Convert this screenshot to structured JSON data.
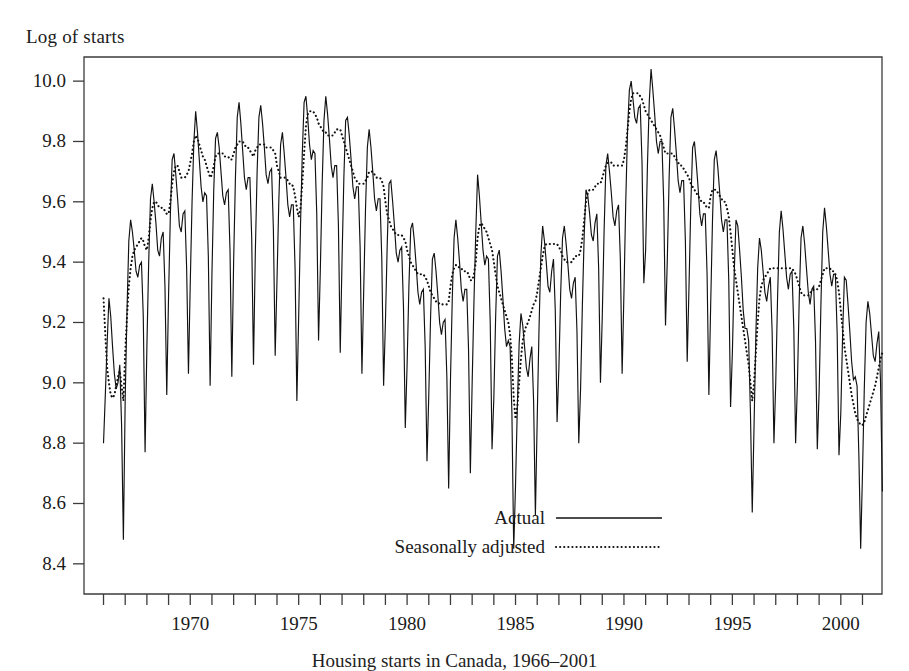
{
  "figure": {
    "ylabel": "Log of starts",
    "caption": "Housing starts in Canada, 1966–2001"
  },
  "legend": {
    "items": [
      {
        "label": "Actual",
        "style": "solid"
      },
      {
        "label": "Seasonally adjusted",
        "style": "dotted"
      }
    ]
  },
  "chart_data": {
    "type": "line",
    "title": "",
    "subtitle": "",
    "xlabel": "",
    "ylabel": "Log of starts",
    "xlim": [
      1965.1,
      2001.9
    ],
    "ylim": [
      8.3,
      10.08
    ],
    "grid": false,
    "legend_position": "bottom-center",
    "yticks": [
      8.4,
      8.6,
      9.0,
      9.2,
      9.4,
      9.6,
      9.8,
      10.0
    ],
    "ytick_labels": [
      "8.4",
      "8.6",
      "8.8",
      "9.0",
      "9.2",
      "9.4",
      "9.6",
      "9.8",
      "10.0"
    ],
    "ytick_values": [
      8.4,
      8.6,
      8.8,
      9.0,
      9.2,
      9.4,
      9.6,
      9.8,
      10.0
    ],
    "xticks_minor_step": 1,
    "xtick_labels": [
      "1970",
      "1975",
      "1980",
      "1985",
      "1990",
      "1995",
      "2000"
    ],
    "xtick_values": [
      1970,
      1975,
      1980,
      1985,
      1990,
      1995,
      2000
    ],
    "x_start": 1966.0,
    "x_step": 0.0833333,
    "n_points": 427,
    "series": [
      {
        "name": "Actual",
        "style": "solid",
        "values": [
          8.8,
          8.96,
          9.13,
          9.28,
          9.22,
          9.12,
          9.03,
          8.98,
          9.0,
          9.06,
          8.86,
          8.48,
          8.95,
          9.24,
          9.47,
          9.54,
          9.5,
          9.44,
          9.37,
          9.35,
          9.39,
          9.4,
          9.22,
          8.77,
          9.12,
          9.4,
          9.61,
          9.66,
          9.6,
          9.53,
          9.44,
          9.42,
          9.48,
          9.5,
          9.32,
          8.96,
          9.29,
          9.56,
          9.74,
          9.76,
          9.69,
          9.61,
          9.52,
          9.5,
          9.56,
          9.57,
          9.38,
          9.03,
          9.33,
          9.6,
          9.8,
          9.9,
          9.83,
          9.74,
          9.65,
          9.6,
          9.63,
          9.62,
          9.42,
          8.99,
          9.36,
          9.64,
          9.81,
          9.83,
          9.78,
          9.7,
          9.62,
          9.59,
          9.63,
          9.64,
          9.44,
          9.02,
          9.4,
          9.68,
          9.88,
          9.93,
          9.86,
          9.77,
          9.68,
          9.64,
          9.68,
          9.68,
          9.48,
          9.06,
          9.43,
          9.7,
          9.88,
          9.92,
          9.86,
          9.78,
          9.69,
          9.66,
          9.7,
          9.71,
          9.51,
          9.09,
          9.34,
          9.6,
          9.79,
          9.83,
          9.76,
          9.68,
          9.59,
          9.55,
          9.59,
          9.59,
          9.38,
          8.94,
          9.22,
          9.52,
          9.76,
          9.93,
          9.95,
          9.88,
          9.79,
          9.74,
          9.77,
          9.76,
          9.56,
          9.14,
          9.38,
          9.66,
          9.87,
          9.95,
          9.89,
          9.81,
          9.72,
          9.68,
          9.72,
          9.72,
          9.52,
          9.1,
          9.41,
          9.68,
          9.87,
          9.88,
          9.82,
          9.74,
          9.65,
          9.61,
          9.65,
          9.65,
          9.45,
          9.03,
          9.31,
          9.58,
          9.78,
          9.84,
          9.78,
          9.7,
          9.61,
          9.57,
          9.61,
          9.61,
          9.41,
          8.99,
          9.2,
          9.46,
          9.66,
          9.67,
          9.6,
          9.52,
          9.43,
          9.4,
          9.44,
          9.45,
          9.25,
          8.85,
          9.06,
          9.32,
          9.51,
          9.53,
          9.47,
          9.39,
          9.3,
          9.26,
          9.3,
          9.31,
          9.12,
          8.74,
          8.96,
          9.22,
          9.41,
          9.43,
          9.37,
          9.29,
          9.2,
          9.16,
          9.2,
          9.21,
          9.02,
          8.65,
          9.01,
          9.28,
          9.48,
          9.54,
          9.48,
          9.4,
          9.31,
          9.27,
          9.31,
          9.31,
          9.11,
          8.7,
          9.0,
          9.27,
          9.5,
          9.69,
          9.62,
          9.53,
          9.44,
          9.39,
          9.42,
          9.41,
          9.2,
          8.78,
          8.95,
          9.22,
          9.42,
          9.44,
          9.37,
          9.28,
          9.18,
          9.12,
          9.14,
          9.12,
          8.9,
          8.45,
          8.66,
          8.92,
          9.13,
          9.23,
          9.19,
          9.12,
          9.05,
          9.02,
          9.08,
          9.12,
          8.94,
          8.56,
          8.88,
          9.18,
          9.42,
          9.52,
          9.47,
          9.4,
          9.32,
          9.3,
          9.37,
          9.41,
          9.24,
          8.87,
          9.05,
          9.3,
          9.48,
          9.52,
          9.46,
          9.39,
          9.31,
          9.28,
          9.33,
          9.35,
          9.17,
          8.8,
          8.98,
          9.26,
          9.49,
          9.64,
          9.62,
          9.56,
          9.49,
          9.47,
          9.53,
          9.56,
          9.38,
          9.0,
          9.22,
          9.5,
          9.72,
          9.76,
          9.7,
          9.63,
          9.55,
          9.52,
          9.57,
          9.59,
          9.41,
          9.03,
          9.3,
          9.6,
          9.84,
          9.97,
          10.0,
          9.94,
          9.88,
          9.86,
          9.91,
          9.92,
          9.73,
          9.33,
          9.44,
          9.72,
          9.93,
          10.04,
          9.97,
          9.89,
          9.8,
          9.76,
          9.8,
          9.8,
          9.6,
          9.19,
          9.41,
          9.68,
          9.88,
          9.91,
          9.84,
          9.76,
          9.67,
          9.63,
          9.67,
          9.67,
          9.47,
          9.07,
          9.32,
          9.59,
          9.78,
          9.8,
          9.73,
          9.65,
          9.56,
          9.52,
          9.56,
          9.56,
          9.36,
          8.96,
          9.26,
          9.54,
          9.74,
          9.77,
          9.71,
          9.63,
          9.54,
          9.5,
          9.54,
          9.54,
          9.34,
          8.92,
          9.1,
          9.36,
          9.54,
          9.52,
          9.44,
          9.35,
          9.24,
          9.18,
          9.18,
          9.14,
          8.9,
          8.57,
          8.86,
          9.16,
          9.38,
          9.48,
          9.44,
          9.37,
          9.3,
          9.27,
          9.32,
          9.35,
          9.17,
          8.8,
          9.0,
          9.28,
          9.5,
          9.57,
          9.51,
          9.43,
          9.35,
          9.31,
          9.36,
          9.37,
          9.18,
          8.8,
          9.0,
          9.28,
          9.48,
          9.52,
          9.46,
          9.38,
          9.3,
          9.26,
          9.31,
          9.32,
          9.14,
          8.78,
          8.97,
          9.26,
          9.5,
          9.58,
          9.52,
          9.44,
          9.36,
          9.32,
          9.36,
          9.36,
          9.16,
          8.76,
          8.9,
          9.16,
          9.35,
          9.34,
          9.26,
          9.17,
          9.07,
          9.01,
          9.02,
          8.99,
          8.76,
          8.45,
          8.7,
          8.98,
          9.2,
          9.27,
          9.23,
          9.16,
          9.09,
          9.07,
          9.13,
          9.17,
          9.0,
          8.64,
          8.86,
          9.14,
          9.36,
          9.44,
          9.39,
          9.32,
          9.25,
          9.23,
          9.28,
          9.31,
          9.13,
          8.77,
          8.92,
          9.19,
          9.39,
          9.43,
          9.37,
          9.3,
          9.22,
          9.19,
          9.24,
          9.26,
          9.08,
          8.71,
          8.93,
          9.22,
          9.45,
          9.53,
          9.48,
          9.41,
          9.34,
          9.32,
          9.37,
          9.4,
          9.22,
          8.86,
          9.02,
          9.3,
          9.52,
          9.57,
          9.52,
          9.45,
          9.38,
          9.35,
          9.4,
          9.43,
          9.26,
          8.9,
          9.04,
          9.32,
          9.54,
          9.57,
          9.48,
          9.41,
          9.46
        ]
      },
      {
        "name": "Seasonally adjusted",
        "style": "dotted",
        "values": [
          9.28,
          9.16,
          9.05,
          9.0,
          8.96,
          8.95,
          8.96,
          8.99,
          9.02,
          9.04,
          8.99,
          8.94,
          9.1,
          9.22,
          9.32,
          9.38,
          9.42,
          9.44,
          9.45,
          9.46,
          9.47,
          9.48,
          9.47,
          9.45,
          9.44,
          9.48,
          9.54,
          9.58,
          9.6,
          9.6,
          9.59,
          9.58,
          9.58,
          9.58,
          9.57,
          9.56,
          9.56,
          9.6,
          9.66,
          9.7,
          9.72,
          9.72,
          9.7,
          9.68,
          9.68,
          9.68,
          9.69,
          9.7,
          9.73,
          9.76,
          9.8,
          9.82,
          9.81,
          9.79,
          9.77,
          9.75,
          9.74,
          9.72,
          9.7,
          9.68,
          9.69,
          9.72,
          9.75,
          9.76,
          9.76,
          9.76,
          9.76,
          9.75,
          9.75,
          9.75,
          9.74,
          9.74,
          9.76,
          9.78,
          9.79,
          9.8,
          9.8,
          9.8,
          9.79,
          9.78,
          9.78,
          9.77,
          9.76,
          9.75,
          9.77,
          9.78,
          9.79,
          9.79,
          9.79,
          9.79,
          9.78,
          9.78,
          9.78,
          9.78,
          9.77,
          9.76,
          9.72,
          9.7,
          9.68,
          9.68,
          9.68,
          9.68,
          9.67,
          9.66,
          9.66,
          9.65,
          9.62,
          9.58,
          9.55,
          9.58,
          9.66,
          9.76,
          9.85,
          9.89,
          9.9,
          9.9,
          9.9,
          9.89,
          9.88,
          9.86,
          9.85,
          9.84,
          9.83,
          9.83,
          9.82,
          9.82,
          9.82,
          9.82,
          9.83,
          9.84,
          9.84,
          9.84,
          9.82,
          9.8,
          9.78,
          9.76,
          9.74,
          9.72,
          9.7,
          9.68,
          9.67,
          9.66,
          9.66,
          9.66,
          9.66,
          9.67,
          9.68,
          9.7,
          9.7,
          9.7,
          9.69,
          9.68,
          9.68,
          9.68,
          9.67,
          9.65,
          9.6,
          9.56,
          9.54,
          9.52,
          9.51,
          9.5,
          9.49,
          9.49,
          9.49,
          9.49,
          9.48,
          9.47,
          9.44,
          9.42,
          9.4,
          9.39,
          9.38,
          9.37,
          9.36,
          9.36,
          9.36,
          9.36,
          9.35,
          9.34,
          9.32,
          9.3,
          9.29,
          9.28,
          9.27,
          9.27,
          9.26,
          9.26,
          9.26,
          9.26,
          9.26,
          9.27,
          9.32,
          9.36,
          9.38,
          9.39,
          9.39,
          9.38,
          9.38,
          9.37,
          9.37,
          9.37,
          9.36,
          9.34,
          9.34,
          9.36,
          9.4,
          9.48,
          9.52,
          9.53,
          9.52,
          9.51,
          9.5,
          9.48,
          9.46,
          9.44,
          9.4,
          9.36,
          9.32,
          9.3,
          9.28,
          9.26,
          9.24,
          9.22,
          9.2,
          9.16,
          9.08,
          8.95,
          8.88,
          8.92,
          9.0,
          9.08,
          9.14,
          9.17,
          9.19,
          9.2,
          9.22,
          9.24,
          9.26,
          9.27,
          9.3,
          9.34,
          9.38,
          9.42,
          9.45,
          9.46,
          9.46,
          9.46,
          9.46,
          9.46,
          9.46,
          9.46,
          9.45,
          9.44,
          9.42,
          9.41,
          9.4,
          9.4,
          9.4,
          9.4,
          9.41,
          9.42,
          9.42,
          9.42,
          9.44,
          9.48,
          9.54,
          9.6,
          9.63,
          9.64,
          9.64,
          9.64,
          9.65,
          9.66,
          9.66,
          9.66,
          9.68,
          9.7,
          9.72,
          9.73,
          9.73,
          9.73,
          9.72,
          9.72,
          9.72,
          9.72,
          9.72,
          9.72,
          9.74,
          9.78,
          9.84,
          9.9,
          9.94,
          9.96,
          9.96,
          9.96,
          9.96,
          9.95,
          9.94,
          9.92,
          9.9,
          9.89,
          9.88,
          9.87,
          9.86,
          9.85,
          9.84,
          9.83,
          9.82,
          9.8,
          9.78,
          9.76,
          9.76,
          9.76,
          9.76,
          9.76,
          9.75,
          9.74,
          9.73,
          9.72,
          9.72,
          9.71,
          9.7,
          9.69,
          9.68,
          9.66,
          9.65,
          9.64,
          9.63,
          9.62,
          9.61,
          9.6,
          9.6,
          9.59,
          9.58,
          9.58,
          9.62,
          9.64,
          9.64,
          9.64,
          9.63,
          9.62,
          9.61,
          9.6,
          9.6,
          9.58,
          9.55,
          9.5,
          9.44,
          9.38,
          9.34,
          9.3,
          9.26,
          9.22,
          9.18,
          9.14,
          9.1,
          9.06,
          9.0,
          8.94,
          9.0,
          9.1,
          9.2,
          9.28,
          9.32,
          9.34,
          9.35,
          9.36,
          9.37,
          9.38,
          9.38,
          9.38,
          9.38,
          9.38,
          9.38,
          9.38,
          9.38,
          9.38,
          9.38,
          9.38,
          9.38,
          9.38,
          9.37,
          9.36,
          9.34,
          9.32,
          9.3,
          9.29,
          9.29,
          9.29,
          9.29,
          9.3,
          9.3,
          9.31,
          9.31,
          9.31,
          9.32,
          9.34,
          9.36,
          9.38,
          9.38,
          9.38,
          9.38,
          9.37,
          9.37,
          9.36,
          9.34,
          9.3,
          9.24,
          9.18,
          9.12,
          9.08,
          9.04,
          9.0,
          8.96,
          8.93,
          8.9,
          8.88,
          8.87,
          8.86,
          8.86,
          8.87,
          8.89,
          8.91,
          8.93,
          8.95,
          8.97,
          8.99,
          9.02,
          9.05,
          9.08,
          9.1,
          9.14,
          9.18,
          9.21,
          9.23,
          9.25,
          9.26,
          9.27,
          9.27,
          9.28,
          9.28,
          9.28,
          9.27,
          9.26,
          9.26,
          9.25,
          9.25,
          9.25,
          9.25,
          9.25,
          9.25,
          9.25,
          9.25,
          9.24,
          9.22,
          9.22,
          9.24,
          9.26,
          9.28,
          9.3,
          9.31,
          9.32,
          9.33,
          9.34,
          9.35,
          9.35,
          9.35,
          9.36,
          9.38,
          9.4,
          9.42,
          9.43,
          9.43,
          9.42,
          9.41,
          9.4,
          9.4,
          9.4,
          9.4,
          9.4,
          9.41,
          9.42,
          9.43,
          9.44,
          9.45,
          9.47
        ]
      }
    ]
  }
}
